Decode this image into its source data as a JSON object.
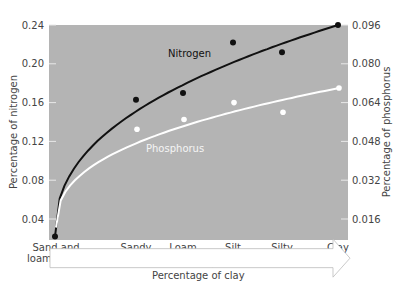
{
  "chart_data": {
    "type": "scatter",
    "title": "",
    "xlabel": "Percentage of clay",
    "ylabel": "Percentage of nitrogen",
    "ylabel_right": "Percentage of phosphorus",
    "categories": [
      "Sand and loamy sand",
      "Sandy loam",
      "Loam",
      "Silt loam",
      "Silty clay loam",
      "Clay"
    ],
    "category_labels": [
      [
        "Sand and",
        "loamy sand"
      ],
      [
        "Sandy",
        "loam"
      ],
      [
        "Loam"
      ],
      [
        "Silt",
        "loam"
      ],
      [
        "Silty",
        "clay loam"
      ],
      [
        "Clay"
      ]
    ],
    "ylim": [
      0.02,
      0.24
    ],
    "ylim_right": [
      0.008,
      0.096
    ],
    "yticks": [
      "0.04",
      "0.08",
      "0.12",
      "0.16",
      "0.20",
      "0.24"
    ],
    "yticks_right": [
      "0.016",
      "0.032",
      "0.048",
      "0.064",
      "0.080",
      "0.096"
    ],
    "series": [
      {
        "name": "Nitrogen",
        "axis": "left",
        "color": "#111111",
        "values": [
          0.022,
          0.163,
          0.17,
          0.222,
          0.212,
          0.24
        ],
        "trend": "logarithmic"
      },
      {
        "name": "Phosphorus",
        "axis": "right",
        "color": "#ffffff",
        "values": [
          null,
          0.053,
          0.057,
          0.064,
          0.06,
          0.07
        ],
        "trend": "logarithmic"
      }
    ],
    "background": "#b3b3b3",
    "grid": false,
    "legend": "inline labels"
  }
}
